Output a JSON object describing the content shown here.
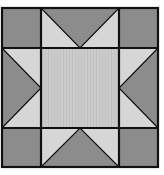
{
  "figure": {
    "title": ""
  },
  "colors": {
    "background": "#ffffff",
    "dark": "#8c8c8c",
    "light": "#d6d6d6",
    "center": "#cbcbcb",
    "outline": "#111111"
  },
  "grid": {
    "x": [
      2,
      41,
      119,
      158
    ],
    "y": [
      8,
      48,
      128,
      167
    ]
  },
  "pieces": [
    {
      "name": "corner-top-left",
      "shape": "square",
      "fill": "dark"
    },
    {
      "name": "corner-top-right",
      "shape": "square",
      "fill": "dark"
    },
    {
      "name": "corner-bottom-left",
      "shape": "square",
      "fill": "dark"
    },
    {
      "name": "corner-bottom-right",
      "shape": "square",
      "fill": "dark"
    },
    {
      "name": "center-square",
      "shape": "square",
      "fill": "center"
    },
    {
      "name": "star-point-top",
      "shape": "flying-geese",
      "fill": "dark",
      "background": "light",
      "pointing": "down"
    },
    {
      "name": "star-point-bottom",
      "shape": "flying-geese",
      "fill": "dark",
      "background": "light",
      "pointing": "up"
    },
    {
      "name": "star-point-left",
      "shape": "flying-geese",
      "fill": "dark",
      "background": "light",
      "pointing": "right"
    },
    {
      "name": "star-point-right",
      "shape": "flying-geese",
      "fill": "dark",
      "background": "light",
      "pointing": "left"
    }
  ]
}
